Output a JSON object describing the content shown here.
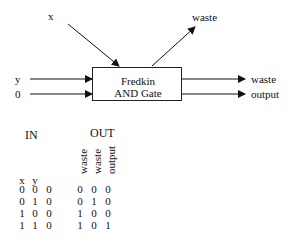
{
  "diagram": {
    "gate": {
      "line1": "Fredkin",
      "line2": "AND Gate"
    },
    "inputs": {
      "top": "x",
      "left1": "y",
      "left2": "0"
    },
    "outputs": {
      "top": "waste",
      "right1": "waste",
      "right2": "output"
    }
  },
  "table": {
    "in_header": "IN",
    "out_header": "OUT",
    "in_columns": [
      "x",
      "y",
      ""
    ],
    "out_columns": [
      "waste",
      "waste",
      "output"
    ],
    "rows": [
      {
        "in": [
          "0",
          "0",
          "0"
        ],
        "out": [
          "0",
          "0",
          "0"
        ]
      },
      {
        "in": [
          "0",
          "1",
          "0"
        ],
        "out": [
          "0",
          "1",
          "0"
        ]
      },
      {
        "in": [
          "1",
          "0",
          "0"
        ],
        "out": [
          "1",
          "0",
          "0"
        ]
      },
      {
        "in": [
          "1",
          "1",
          "0"
        ],
        "out": [
          "1",
          "0",
          "1"
        ]
      }
    ]
  }
}
